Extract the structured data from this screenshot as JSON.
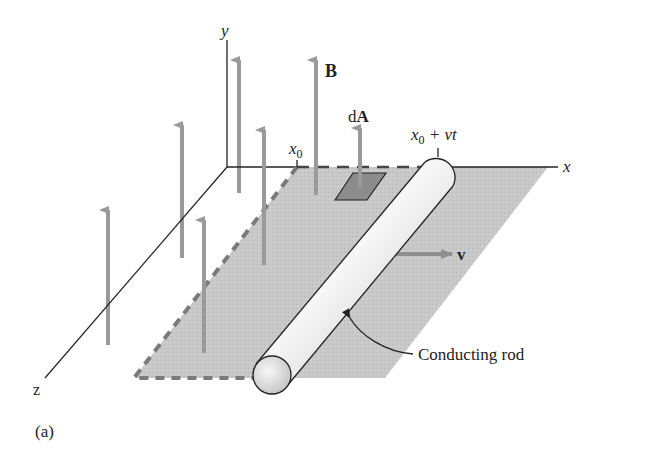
{
  "figure": {
    "panel_label": "(a)",
    "axes": {
      "x_label": "x",
      "y_label": "y",
      "z_label": "z"
    },
    "labels": {
      "field": "B",
      "area_prefix": "d",
      "area_vec": "A",
      "x0_base": "x",
      "x0_sub": "0",
      "rod_pos_base": "x",
      "rod_pos_sub": "0",
      "rod_pos_rest": " + vt",
      "velocity": "v",
      "rod_callout": "Conducting rod"
    },
    "colors": {
      "arrow": "#9a9a9a",
      "plane": "#c9c9c9",
      "plane_edge": "#7a7a7a",
      "patch": "#8c8c8c",
      "rod_light": "#f2f2f2",
      "rod_dark": "#c4c4c4",
      "ink": "#222222"
    }
  }
}
